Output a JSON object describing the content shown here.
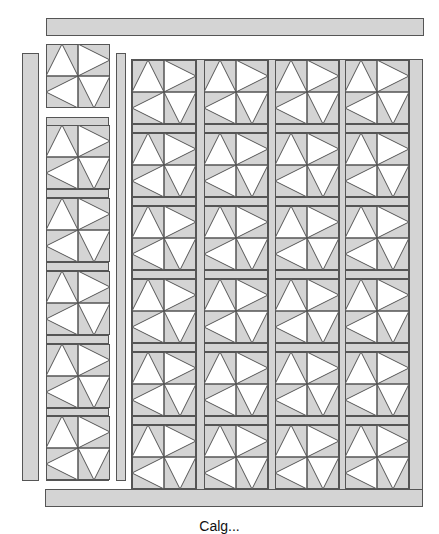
{
  "diagram": {
    "caption": "Calg...",
    "colors": {
      "fabric_gray": "#d4d4d4",
      "fabric_white": "#ffffff",
      "outline": "#555555"
    },
    "block_pattern": {
      "name": "pinwheel-triangle block",
      "quadrants": [
        "triangle-up",
        "triangle-right",
        "triangle-left",
        "triangle-down"
      ]
    },
    "top_border": {
      "x": 46,
      "y": 18,
      "w": 378,
      "h": 18
    },
    "bottom_border": {
      "x": 45,
      "y": 489,
      "w": 378,
      "h": 18
    },
    "left_border": {
      "x": 22,
      "y": 53,
      "w": 17,
      "h": 428
    },
    "left_sash_strip": {
      "x": 116,
      "y": 53,
      "w": 10,
      "h": 428
    },
    "loose_block": {
      "x": 46,
      "y": 44
    },
    "left_column": {
      "x": 46,
      "y": 117,
      "w": 63,
      "h": 364,
      "block_count": 5,
      "block_y": [
        125,
        198,
        271,
        344,
        416
      ]
    },
    "main_grid": {
      "x": 131,
      "y": 59,
      "w": 292,
      "h": 431,
      "columns": 4,
      "rows": 6,
      "col_x": [
        132,
        204,
        275,
        345
      ],
      "row_y": [
        60,
        133,
        206,
        279,
        352,
        425
      ]
    }
  }
}
